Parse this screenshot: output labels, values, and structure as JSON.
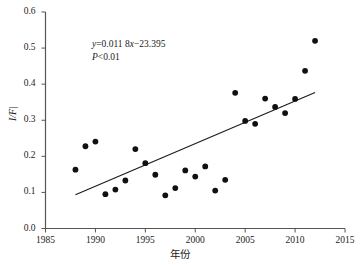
{
  "chart_data": {
    "type": "scatter",
    "title": "",
    "xlabel": "年份",
    "ylabel": "I/F|",
    "xlim": [
      1985,
      2015
    ],
    "ylim": [
      0.0,
      0.6
    ],
    "xticks": [
      "1985",
      "1990",
      "1995",
      "2000",
      "2005",
      "2010",
      "2015"
    ],
    "yticks": [
      "0.0",
      "0.1",
      "0.2",
      "0.3",
      "0.4",
      "0.5",
      "0.6"
    ],
    "grid": false,
    "legend": "none",
    "marker_color": "#101010",
    "line_color": "#1a1a1a",
    "axis_color": "#555555",
    "points": [
      {
        "x": 1988,
        "y": 0.163
      },
      {
        "x": 1989,
        "y": 0.228
      },
      {
        "x": 1990,
        "y": 0.241
      },
      {
        "x": 1991,
        "y": 0.095
      },
      {
        "x": 1992,
        "y": 0.108
      },
      {
        "x": 1993,
        "y": 0.133
      },
      {
        "x": 1994,
        "y": 0.22
      },
      {
        "x": 1995,
        "y": 0.181
      },
      {
        "x": 1996,
        "y": 0.149
      },
      {
        "x": 1997,
        "y": 0.092
      },
      {
        "x": 1998,
        "y": 0.112
      },
      {
        "x": 1999,
        "y": 0.161
      },
      {
        "x": 2000,
        "y": 0.144
      },
      {
        "x": 2001,
        "y": 0.172
      },
      {
        "x": 2002,
        "y": 0.105
      },
      {
        "x": 2003,
        "y": 0.135
      },
      {
        "x": 2004,
        "y": 0.376
      },
      {
        "x": 2005,
        "y": 0.298
      },
      {
        "x": 2006,
        "y": 0.29
      },
      {
        "x": 2007,
        "y": 0.36
      },
      {
        "x": 2008,
        "y": 0.337
      },
      {
        "x": 2009,
        "y": 0.32
      },
      {
        "x": 2010,
        "y": 0.359
      },
      {
        "x": 2011,
        "y": 0.437
      },
      {
        "x": 2012,
        "y": 0.52
      }
    ],
    "trendline": {
      "slope": 0.0118,
      "intercept": -23.395,
      "x_start": 1988,
      "x_end": 2012,
      "y_start": 0.0934,
      "y_end": 0.3766
    },
    "annotations": {
      "equation_y": "y",
      "equation_rest": "=0.011 8",
      "equation_x": "x",
      "equation_tail": "−23.395",
      "equation_full": "y=0.011 8x−23.395",
      "pvalue_symbol": "P",
      "pvalue_rest": "<0.01",
      "pvalue_full": "P<0.01"
    }
  }
}
